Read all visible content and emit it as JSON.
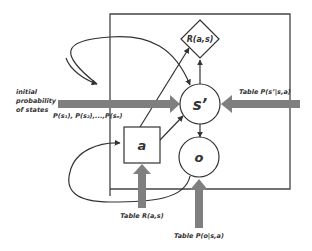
{
  "diagram": {
    "nodes": {
      "state_next": {
        "label": "s’",
        "shape": "circle"
      },
      "observation": {
        "label": "o",
        "shape": "circle"
      },
      "action": {
        "label": "a",
        "shape": "square"
      },
      "reward": {
        "label": "R(a,s)",
        "shape": "diamond"
      }
    },
    "inputs": {
      "initial": {
        "line1": "initial",
        "line2": "probability",
        "line3": "of states",
        "formula": "P(s₁), P(s₂),...,P(sₙ)"
      },
      "transition_table": "Table P(s’|s,a)",
      "reward_table": "Table R(a,s)",
      "observation_table": "Table P(o|s,a)"
    },
    "colors": {
      "line": "#333333",
      "thick_arrow": "#7f7f7f",
      "text": "#333333",
      "background": "#ffffff"
    }
  }
}
